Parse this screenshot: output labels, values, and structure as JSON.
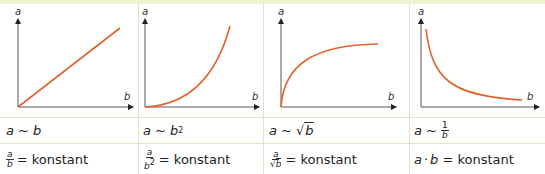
{
  "colors": {
    "curve": "#e2632e",
    "axis": "#444444",
    "border": "#dfe3c8",
    "top_band": "#eef3d2"
  },
  "axes": {
    "y_label": "a",
    "x_label": "b"
  },
  "panels": [
    {
      "curve_type": "linear",
      "relation": {
        "lhs": "a",
        "sym": "~",
        "rhs": "b"
      },
      "constant": {
        "num": "a",
        "den": "b",
        "eq": "= konstant"
      }
    },
    {
      "curve_type": "quadratic",
      "relation": {
        "lhs": "a",
        "sym": "~",
        "rhs": "b",
        "exp": "2"
      },
      "constant": {
        "num": "a",
        "den": "b",
        "den_exp": "2",
        "eq": "= konstant"
      }
    },
    {
      "curve_type": "square-root",
      "relation": {
        "lhs": "a",
        "sym": "~",
        "rad": "√",
        "rhs": "b"
      },
      "constant": {
        "num": "a",
        "rad": "√",
        "den": "b",
        "eq": "= konstant"
      }
    },
    {
      "curve_type": "inverse",
      "relation": {
        "lhs": "a",
        "sym": "~",
        "num": "1",
        "den": "b"
      },
      "constant": {
        "a": "a",
        "dot": "·",
        "b": "b",
        "eq": "= konstant"
      }
    }
  ]
}
